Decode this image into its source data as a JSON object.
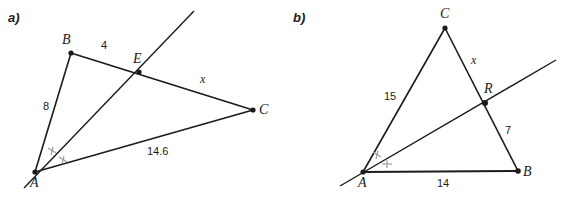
{
  "figure": {
    "width": 569,
    "height": 197,
    "background": "#ffffff",
    "stroke_color": "#1b1b1b",
    "tick_color": "#8c8c8c"
  },
  "panels": [
    {
      "id": "a",
      "label": "a)",
      "description": "Triangle ABC with a ray from A through E on segment BC; angle at A is bisected (double tick marks).",
      "vertices": [
        {
          "name": "A",
          "label": "A",
          "x": 35,
          "y": 172
        },
        {
          "name": "B",
          "label": "B",
          "x": 71,
          "y": 53
        },
        {
          "name": "C",
          "label": "C",
          "x": 253,
          "y": 110
        },
        {
          "name": "E",
          "label": "E",
          "x": 139,
          "y": 72
        }
      ],
      "segments": [
        {
          "name": "AB",
          "from": "A",
          "to": "B"
        },
        {
          "name": "BE",
          "from": "B",
          "to": "E"
        },
        {
          "name": "EC",
          "from": "E",
          "to": "C"
        },
        {
          "name": "AC",
          "from": "A",
          "to": "C"
        }
      ],
      "ray": {
        "name": "ray-AE-extended",
        "from_x": 24,
        "from_y": 188,
        "to_x": 194,
        "to_y": 11
      },
      "measures": [
        {
          "name": "AB",
          "value": "8",
          "x": 47,
          "y": 107
        },
        {
          "name": "BE",
          "value": "4",
          "x": 104,
          "y": 46
        },
        {
          "name": "EC",
          "value": "x",
          "x": 203,
          "y": 79,
          "style": "var"
        },
        {
          "name": "AC",
          "value": "14.6",
          "x": 159,
          "y": 152
        }
      ],
      "angle_marks": {
        "name": "angle-bisector-marks-at-A",
        "count": 2
      }
    },
    {
      "id": "b",
      "label": "b)",
      "description": "Triangle ABC with a ray from A through R on segment CB; angle at A is bisected (double tick marks).",
      "vertices": [
        {
          "name": "A",
          "label": "A",
          "x": 363,
          "y": 172
        },
        {
          "name": "B",
          "label": "B",
          "x": 518,
          "y": 171
        },
        {
          "name": "C",
          "label": "C",
          "x": 445,
          "y": 28
        },
        {
          "name": "R",
          "label": "R",
          "x": 485,
          "y": 103
        }
      ],
      "segments": [
        {
          "name": "AC",
          "from": "A",
          "to": "C"
        },
        {
          "name": "CR",
          "from": "C",
          "to": "R"
        },
        {
          "name": "RB",
          "from": "R",
          "to": "B"
        },
        {
          "name": "AB",
          "from": "A",
          "to": "B"
        }
      ],
      "ray": {
        "name": "ray-AR-extended",
        "from_x": 340,
        "from_y": 186,
        "to_x": 556,
        "to_y": 60
      },
      "measures": [
        {
          "name": "AC",
          "value": "15",
          "x": 390,
          "y": 97
        },
        {
          "name": "CR",
          "value": "x",
          "x": 473,
          "y": 60,
          "style": "var"
        },
        {
          "name": "RB",
          "value": "7",
          "x": 508,
          "y": 131
        },
        {
          "name": "AB",
          "value": "14",
          "x": 440,
          "y": 184
        }
      ],
      "angle_marks": {
        "name": "angle-bisector-marks-at-A",
        "count": 2
      }
    }
  ]
}
